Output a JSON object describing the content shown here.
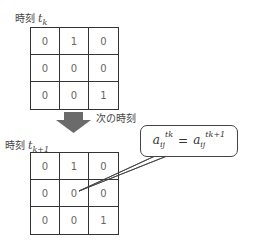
{
  "top": {
    "label_prefix": "時刻",
    "label_var": "t",
    "label_sub": "k",
    "matrix": [
      [
        "0",
        "1",
        "0"
      ],
      [
        "0",
        "0",
        "0"
      ],
      [
        "0",
        "0",
        "1"
      ]
    ]
  },
  "arrow": {
    "label": "次の時刻",
    "color": "#6b6b6b"
  },
  "bottom": {
    "label_prefix": "時刻",
    "label_var": "t",
    "label_sub": "k+1",
    "matrix": [
      [
        "0",
        "1",
        "0"
      ],
      [
        "0",
        "0",
        "0"
      ],
      [
        "0",
        "0",
        "1"
      ]
    ]
  },
  "callout": {
    "lhs_var": "a",
    "lhs_sub": "ij",
    "lhs_sup": "tk",
    "equals": "=",
    "rhs_var": "a",
    "rhs_sub": "ij",
    "rhs_sup": "tk+1",
    "points_to": "center cell (row 2, col 2) of bottom matrix"
  }
}
